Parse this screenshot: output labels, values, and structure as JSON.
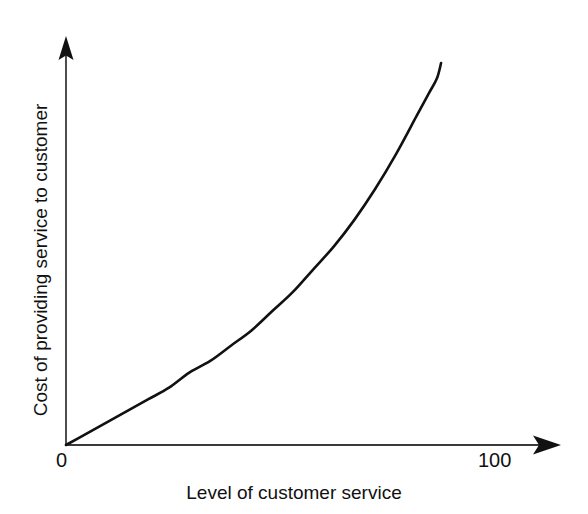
{
  "chart_data": {
    "type": "line",
    "title": "",
    "subtitle": "",
    "xlabel": "Level of customer service",
    "ylabel": "Cost of providing service to customer",
    "xticks": [
      "0",
      "100"
    ],
    "xtick_values": [
      0,
      100
    ],
    "yticks": [],
    "xlim": [
      0,
      115
    ],
    "ylim": [
      0,
      100
    ],
    "grid": false,
    "legend": null,
    "annotations": [],
    "axis_style": "arrow-axes",
    "series": [
      {
        "name": "Cost of providing service to customer",
        "color": "#111111",
        "line_width": 2.6,
        "x": [
          0,
          5,
          10,
          15,
          20,
          25,
          30,
          35,
          40,
          45,
          50,
          55,
          60,
          65,
          70,
          75,
          80,
          85,
          88,
          90,
          91
        ],
        "y": [
          0,
          3,
          6,
          9,
          12,
          15,
          19,
          22,
          26,
          30,
          35,
          40,
          46,
          52,
          59,
          67,
          76,
          86,
          92,
          96,
          100
        ]
      }
    ]
  },
  "axes": {
    "x_axis_tick_zero": "0",
    "x_axis_tick_max": "100",
    "x_axis_label": "Level of customer service",
    "y_axis_label": "Cost of providing service to customer"
  },
  "colors": {
    "background": "#ffffff",
    "axis": "#3a3a3a",
    "curve": "#111111",
    "text": "#111111"
  }
}
